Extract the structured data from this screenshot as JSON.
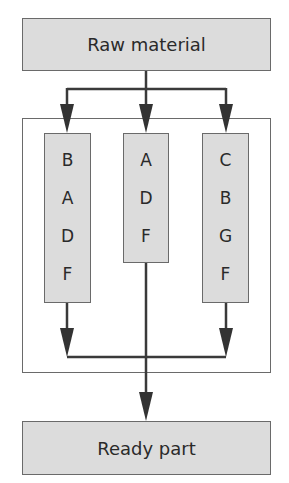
{
  "diagram": {
    "top_box": {
      "label": "Raw material"
    },
    "bottom_box": {
      "label": "Ready part"
    },
    "columns": [
      {
        "steps": [
          "B",
          "A",
          "D",
          "F"
        ]
      },
      {
        "steps": [
          "A",
          "D",
          "F"
        ]
      },
      {
        "steps": [
          "C",
          "B",
          "G",
          "F"
        ]
      }
    ],
    "colors": {
      "box_fill": "#dcdcdc",
      "line": "#3a3a3a",
      "border": "#6a6a6a"
    }
  }
}
